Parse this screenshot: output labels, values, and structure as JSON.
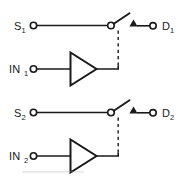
{
  "diagram": {
    "background_color": "#ffffff",
    "line_color": "#1a1a1a",
    "control_line_color": "#2b2b2b",
    "channels": [
      {
        "id": "channel-1",
        "source_label": "S",
        "source_subscript": "1",
        "drain_label": "D",
        "drain_subscript": "1",
        "input_label": "IN",
        "input_subscript": "1",
        "switch_state": "open",
        "control_link": "dashed"
      },
      {
        "id": "channel-2",
        "source_label": "S",
        "source_subscript": "2",
        "drain_label": "D",
        "drain_subscript": "2",
        "input_label": "IN",
        "input_subscript": "2",
        "switch_state": "open",
        "control_link": "dashed"
      }
    ],
    "symbols": {
      "terminal": "open-circle-terminal",
      "buffer": "buffer-amplifier-triangle",
      "switch": "spst-switch-blade",
      "arrow": "filled-up-triangle-arrowhead"
    }
  }
}
